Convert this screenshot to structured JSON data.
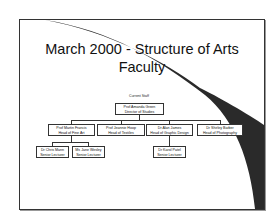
{
  "slide": {
    "title_line1": "March 2000 - Structure of Arts",
    "title_line2": "Faculty",
    "caption": "Current Staff"
  },
  "org_chart": {
    "root": {
      "name": "Prof Amanda Green",
      "role": "Director of Studies"
    },
    "heads": [
      {
        "name": "Prof Martin Francis",
        "role": "Head of Fine Art"
      },
      {
        "name": "Prof Jeannie Hoop",
        "role": "Head of Textiles"
      },
      {
        "name": "Dr Alan James",
        "role": "Head of Graphic Design"
      },
      {
        "name": "Dr Shirley Barber",
        "role": "Head of Photography"
      }
    ],
    "staff": [
      {
        "name": "Dr Chris Mann",
        "role": "Senior Lecturer",
        "reports_to": "Prof Martin Francis"
      },
      {
        "name": "Ms Jane Wesley",
        "role": "Senior Lecturer",
        "reports_to": "Prof Martin Francis"
      },
      {
        "name": "Dr Karol Patel",
        "role": "Senior Lecturer",
        "reports_to": "Dr Alan James"
      }
    ]
  },
  "colors": {
    "border": "#333333",
    "swoosh": "#2a2a2a",
    "background": "#ffffff"
  }
}
